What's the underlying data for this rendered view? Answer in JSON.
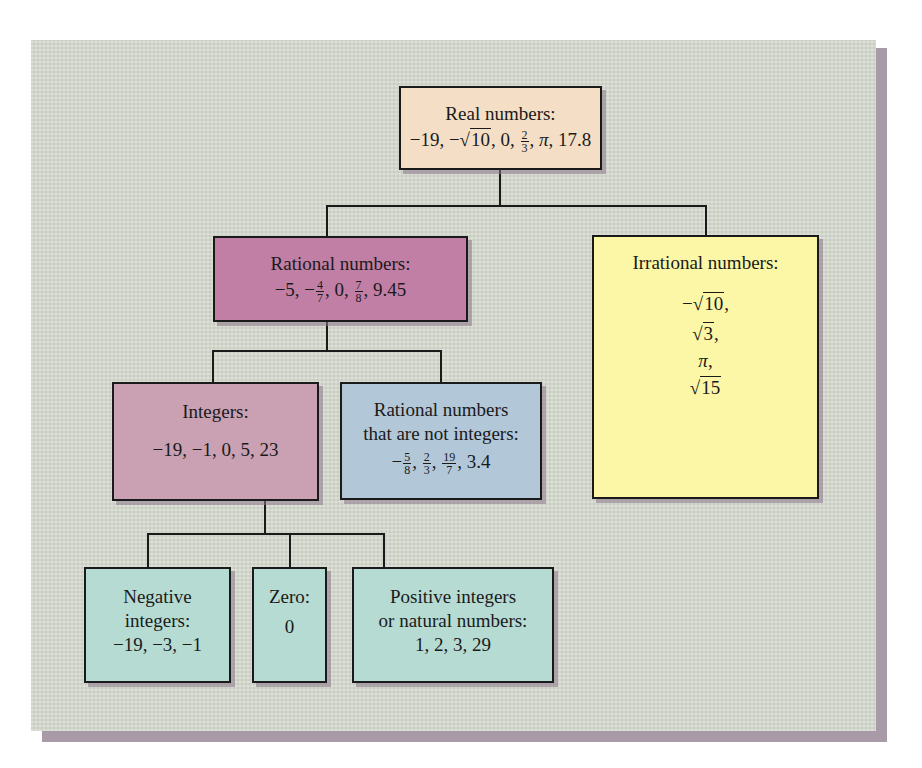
{
  "diagram": {
    "colors": {
      "background_panel": "#d5dace",
      "panel_shadow": "#a89aa6",
      "real": "#f4dfc6",
      "rational": "#c27fa6",
      "irrational": "#fbf7a7",
      "integers": "#c9a1b3",
      "not_integers": "#b2c7d8",
      "integer_subsets": "#b6dbd3",
      "lines": "#1a1a1a"
    },
    "nodes": {
      "real": {
        "label": "Real numbers:",
        "examples": [
          "−19",
          "−√10",
          "0",
          "2/3",
          "π",
          "17.8"
        ]
      },
      "rational": {
        "label": "Rational numbers:",
        "examples": [
          "−5",
          "−4/7",
          "0",
          "7/8",
          "9.45"
        ]
      },
      "irrational": {
        "label": "Irrational numbers:",
        "examples": [
          "−√10,",
          "√3,",
          "π,",
          "√15"
        ]
      },
      "integers": {
        "label": "Integers:",
        "examples": "−19, −1, 0, 5, 23"
      },
      "not_integers": {
        "label_line1": "Rational numbers",
        "label_line2": "that are not integers:",
        "examples": [
          "−5/8",
          "2/3",
          "19/7",
          "3.4"
        ]
      },
      "negative": {
        "label_line1": "Negative",
        "label_line2": "integers:",
        "examples": "−19, −3, −1"
      },
      "zero": {
        "label": "Zero:",
        "examples": "0"
      },
      "positive": {
        "label_line1": "Positive integers",
        "label_line2": "or natural numbers:",
        "examples": "1, 2, 3, 29"
      }
    },
    "edges": [
      [
        "real",
        "rational"
      ],
      [
        "real",
        "irrational"
      ],
      [
        "rational",
        "integers"
      ],
      [
        "rational",
        "not_integers"
      ],
      [
        "integers",
        "negative"
      ],
      [
        "integers",
        "zero"
      ],
      [
        "integers",
        "positive"
      ]
    ]
  },
  "glyphs": {
    "minus": "−",
    "sqrt": "√",
    "pi": "π",
    "comma": ",",
    "n10": "10",
    "n3": "3",
    "n15": "15",
    "n2": "2",
    "n4": "4",
    "n5": "5",
    "n7": "7",
    "n8": "8",
    "n19": "19",
    "real_pre": "−19, −",
    "real_post1": ", 0, ",
    "real_post2": ", ",
    "real_post3": ", 17.8",
    "rat_pre": "−5, −",
    "rat_mid": ", 0, ",
    "rat_post": ", 9.45",
    "ni_pre": "−",
    "ni_sep": ", ",
    "ni_post": ", 3.4"
  }
}
